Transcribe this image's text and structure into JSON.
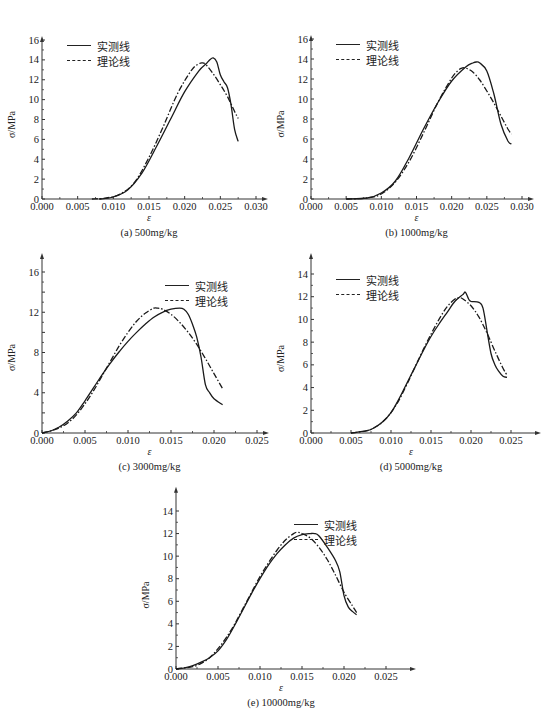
{
  "legend": {
    "measured": "实测线",
    "theoretical": "理论线"
  },
  "chart_data": [
    {
      "id": "a",
      "type": "line",
      "title": "(a) 500mg/kg",
      "xlabel": "ε",
      "ylabel": "σ/MPa",
      "xlim": [
        0,
        0.03
      ],
      "ylim": [
        0,
        16
      ],
      "xticks": [
        "0.000",
        "0.005",
        "0.010",
        "0.015",
        "0.020",
        "0.025",
        "0.030"
      ],
      "yticks": [
        "0",
        "2",
        "4",
        "6",
        "8",
        "10",
        "12",
        "14",
        "16"
      ],
      "grid": false,
      "legend_position": "upper-left",
      "box": {
        "x0": 42,
        "y0": 199,
        "x1": 256,
        "ytop": 40,
        "xmax_px": 264,
        "ymax_px": 16
      },
      "series": [
        {
          "name": "实测线",
          "style": "solid",
          "x": [
            0.008,
            0.01,
            0.012,
            0.014,
            0.016,
            0.018,
            0.02,
            0.022,
            0.023,
            0.0235,
            0.024,
            0.0245,
            0.025,
            0.0255,
            0.026,
            0.0265,
            0.027,
            0.0275
          ],
          "y": [
            0,
            0.2,
            0.9,
            2.6,
            5.2,
            8.0,
            10.8,
            12.9,
            13.6,
            14.0,
            14.2,
            13.8,
            12.5,
            11.8,
            11.2,
            9.5,
            7.0,
            5.8
          ]
        },
        {
          "name": "理论线",
          "style": "dashdot",
          "x": [
            0.007,
            0.009,
            0.011,
            0.013,
            0.015,
            0.017,
            0.019,
            0.021,
            0.022,
            0.0225,
            0.023,
            0.024,
            0.025,
            0.026,
            0.027,
            0.0275
          ],
          "y": [
            0,
            0.1,
            0.5,
            1.7,
            4.2,
            7.3,
            10.6,
            13.0,
            13.6,
            13.7,
            13.5,
            12.6,
            11.5,
            10.3,
            8.8,
            8.1
          ]
        }
      ]
    },
    {
      "id": "b",
      "type": "line",
      "title": "(b) 1000mg/kg",
      "xlabel": "ε",
      "ylabel": "σ/MPa",
      "xlim": [
        0,
        0.03
      ],
      "ylim": [
        0,
        16
      ],
      "xticks": [
        "0.000",
        "0.005",
        "0.010",
        "0.015",
        "0.020",
        "0.025",
        "0.030"
      ],
      "yticks": [
        "0",
        "2",
        "4",
        "6",
        "8",
        "10",
        "12",
        "14",
        "16"
      ],
      "grid": false,
      "legend_position": "upper-left",
      "box": {
        "x0": 311,
        "y0": 199,
        "x1": 522,
        "ytop": 39,
        "xmax_px": 530,
        "ymax_px": 16
      },
      "series": [
        {
          "name": "实测线",
          "style": "solid",
          "x": [
            0.005,
            0.008,
            0.01,
            0.012,
            0.014,
            0.016,
            0.018,
            0.02,
            0.022,
            0.023,
            0.0235,
            0.024,
            0.025,
            0.026,
            0.027,
            0.028,
            0.0285
          ],
          "y": [
            0,
            0.1,
            0.6,
            1.8,
            4.2,
            7.0,
            9.6,
            11.8,
            13.2,
            13.6,
            13.7,
            13.6,
            12.8,
            10.5,
            7.5,
            5.8,
            5.5
          ]
        },
        {
          "name": "理论线",
          "style": "dashdot",
          "x": [
            0.005,
            0.008,
            0.01,
            0.012,
            0.014,
            0.016,
            0.018,
            0.02,
            0.021,
            0.0215,
            0.022,
            0.023,
            0.024,
            0.025,
            0.026,
            0.027,
            0.028,
            0.0285
          ],
          "y": [
            0,
            0.1,
            0.5,
            1.7,
            3.8,
            6.6,
            9.6,
            12.1,
            12.9,
            13.1,
            13.1,
            12.7,
            11.9,
            10.8,
            9.6,
            8.3,
            7.0,
            6.5
          ]
        }
      ]
    },
    {
      "id": "c",
      "type": "line",
      "title": "(c) 3000mg/kg",
      "xlabel": "ε",
      "ylabel": "σ/MPa",
      "xlim": [
        0,
        0.025
      ],
      "ylim": [
        0,
        16
      ],
      "xticks": [
        "0.000",
        "0.005",
        "0.010",
        "0.015",
        "0.020",
        "0.025"
      ],
      "yticks": [
        "0",
        "",
        "4",
        "",
        "8",
        "",
        "12",
        "",
        "16"
      ],
      "grid": false,
      "legend_position": "upper-right",
      "box": {
        "x0": 42,
        "y0": 433,
        "x1": 257,
        "ytop": 272,
        "xmax_px": 265,
        "ymax_px": 17.5
      },
      "series": [
        {
          "name": "实测线",
          "style": "solid",
          "x": [
            0,
            0.001,
            0.002,
            0.003,
            0.004,
            0.005,
            0.006,
            0.007,
            0.008,
            0.009,
            0.01,
            0.011,
            0.012,
            0.013,
            0.014,
            0.015,
            0.016,
            0.0165,
            0.017,
            0.0175,
            0.018,
            0.0185,
            0.019,
            0.0195,
            0.02,
            0.021
          ],
          "y": [
            0,
            0.2,
            0.6,
            1.2,
            2.0,
            3.2,
            4.5,
            5.8,
            7.0,
            8.1,
            9.1,
            10.0,
            10.8,
            11.5,
            12.0,
            12.3,
            12.4,
            12.3,
            11.8,
            10.8,
            9.5,
            7.5,
            4.8,
            4.0,
            3.4,
            2.8
          ]
        },
        {
          "name": "理论线",
          "style": "dashdot",
          "x": [
            0,
            0.001,
            0.002,
            0.003,
            0.004,
            0.005,
            0.006,
            0.007,
            0.008,
            0.009,
            0.01,
            0.011,
            0.012,
            0.013,
            0.0135,
            0.014,
            0.015,
            0.016,
            0.017,
            0.018,
            0.019,
            0.02,
            0.021
          ],
          "y": [
            0,
            0.2,
            0.5,
            1.0,
            1.8,
            2.9,
            4.2,
            5.7,
            7.2,
            8.7,
            10.0,
            11.1,
            11.9,
            12.4,
            12.4,
            12.3,
            11.8,
            11.0,
            10.0,
            8.8,
            7.4,
            5.9,
            4.4
          ]
        }
      ]
    },
    {
      "id": "d",
      "type": "line",
      "title": "(d) 5000mg/kg",
      "xlabel": "ε",
      "ylabel": "σ/MPa",
      "xlim": [
        0,
        0.025
      ],
      "ylim": [
        0,
        14
      ],
      "xticks": [
        "0.000",
        "0.005",
        "0.010",
        "0.015",
        "0.020",
        "0.025"
      ],
      "yticks": [
        "0",
        "2",
        "4",
        "6",
        "8",
        "10",
        "12",
        "14"
      ],
      "grid": false,
      "legend_position": "upper-left",
      "box": {
        "x0": 311,
        "y0": 433,
        "x1": 511,
        "ytop": 274,
        "xmax_px": 537,
        "ymax_px": 15.5
      },
      "series": [
        {
          "name": "实测线",
          "style": "solid",
          "x": [
            0.005,
            0.007,
            0.008,
            0.009,
            0.01,
            0.011,
            0.012,
            0.013,
            0.014,
            0.015,
            0.016,
            0.017,
            0.018,
            0.019,
            0.0193,
            0.0197,
            0.02,
            0.021,
            0.0215,
            0.022,
            0.0225,
            0.023,
            0.0235,
            0.024,
            0.0245
          ],
          "y": [
            0,
            0.2,
            0.5,
            1.0,
            1.8,
            3.0,
            4.4,
            5.8,
            7.2,
            8.5,
            9.6,
            10.6,
            11.6,
            12.2,
            12.4,
            11.8,
            11.6,
            11.5,
            11.0,
            9.0,
            7.0,
            6.0,
            5.4,
            5.0,
            4.9
          ]
        },
        {
          "name": "理论线",
          "style": "dashdot",
          "x": [
            0.005,
            0.007,
            0.008,
            0.009,
            0.01,
            0.011,
            0.012,
            0.013,
            0.014,
            0.015,
            0.016,
            0.017,
            0.018,
            0.0185,
            0.019,
            0.02,
            0.021,
            0.022,
            0.023,
            0.024,
            0.0245
          ],
          "y": [
            0,
            0.2,
            0.5,
            1.0,
            1.8,
            2.9,
            4.3,
            5.8,
            7.3,
            8.7,
            10.0,
            11.1,
            11.8,
            11.9,
            11.8,
            11.2,
            10.2,
            8.8,
            7.2,
            5.7,
            5.1
          ]
        }
      ]
    },
    {
      "id": "e",
      "type": "line",
      "title": "(e) 10000mg/kg",
      "xlabel": "ε",
      "ylabel": "σ/MPa",
      "xlim": [
        0,
        0.025
      ],
      "ylim": [
        0,
        14
      ],
      "xticks": [
        "0.000",
        "0.005",
        "0.010",
        "0.015",
        "0.020",
        "0.025"
      ],
      "yticks": [
        "0",
        "2",
        "4",
        "6",
        "8",
        "10",
        "12",
        "14"
      ],
      "grid": false,
      "legend_position": "upper-right",
      "box": {
        "x0": 176,
        "y0": 669,
        "x1": 386,
        "ytop": 511,
        "xmax_px": 412,
        "ymax_px": 15.8
      },
      "series": [
        {
          "name": "实测线",
          "style": "solid",
          "x": [
            0,
            0.001,
            0.002,
            0.003,
            0.004,
            0.005,
            0.006,
            0.007,
            0.008,
            0.009,
            0.01,
            0.011,
            0.012,
            0.013,
            0.014,
            0.015,
            0.016,
            0.0165,
            0.017,
            0.018,
            0.019,
            0.0195,
            0.02,
            0.0205,
            0.021,
            0.0215
          ],
          "y": [
            0,
            0.1,
            0.3,
            0.6,
            1.0,
            1.6,
            2.6,
            3.9,
            5.3,
            6.7,
            8.0,
            9.2,
            10.2,
            11.0,
            11.6,
            11.9,
            12.0,
            12.0,
            11.8,
            10.8,
            9.6,
            8.6,
            6.5,
            5.5,
            5.1,
            4.8
          ]
        },
        {
          "name": "理论线",
          "style": "dashdot",
          "x": [
            0,
            0.001,
            0.002,
            0.003,
            0.004,
            0.005,
            0.006,
            0.007,
            0.008,
            0.009,
            0.01,
            0.011,
            0.012,
            0.013,
            0.014,
            0.0145,
            0.015,
            0.016,
            0.017,
            0.018,
            0.019,
            0.02,
            0.021,
            0.0215
          ],
          "y": [
            0,
            0.1,
            0.2,
            0.5,
            1.0,
            1.8,
            2.8,
            4.0,
            5.4,
            6.8,
            8.2,
            9.4,
            10.5,
            11.4,
            12.0,
            12.1,
            12.0,
            11.6,
            10.8,
            9.7,
            8.3,
            6.8,
            5.6,
            5.0
          ]
        }
      ]
    }
  ]
}
